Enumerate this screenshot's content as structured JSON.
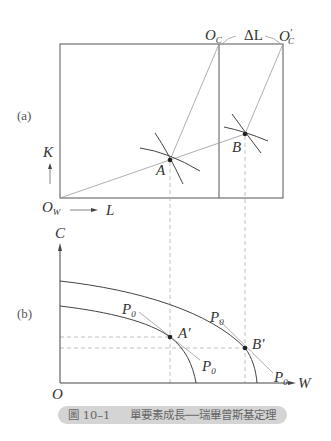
{
  "panel_a": {
    "label": "(a)",
    "origin_worker": "O",
    "origin_worker_sub": "W",
    "origin_capital": "O",
    "origin_capital_sub": "C",
    "origin_capital_new": "O",
    "origin_capital_new_prime": "′",
    "origin_capital_new_sub": "C",
    "delta_label": "ΔL",
    "axis_k": "K",
    "axis_l": "L",
    "point_a": "A",
    "point_b": "B"
  },
  "panel_b": {
    "label": "(b)",
    "axis_c": "C",
    "axis_w": "W",
    "origin": "O",
    "point_a_prime": "A′",
    "point_b_prime": "B′",
    "price_label": "P",
    "price_sub": "0"
  },
  "caption": {
    "number": "圖 10–1",
    "title": "單要素成長──瑞畢曾斯基定理"
  },
  "colors": {
    "line_dark": "#444444",
    "line_light": "#9a9a9a",
    "dashed": "#b0b0b0",
    "caption_bg": "#d4d4d4"
  }
}
